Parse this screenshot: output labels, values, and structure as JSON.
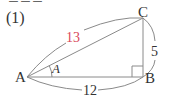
{
  "problem": {
    "number_label": "(1)",
    "top_cut_text": "ーーー"
  },
  "triangle": {
    "vertices": {
      "A": {
        "label": "A",
        "x": 27,
        "y": 77
      },
      "B": {
        "label": "B",
        "x": 143,
        "y": 77
      },
      "C": {
        "label": "C",
        "x": 143,
        "y": 18
      }
    },
    "sides": {
      "AC": {
        "label": "13",
        "color": "#d9465a"
      },
      "AB": {
        "label": "12",
        "color": "#333333"
      },
      "BC": {
        "label": "5",
        "color": "#333333"
      }
    },
    "angle_label": "A",
    "right_angle_at": "B"
  },
  "colors": {
    "line": "#8a8a8a",
    "text": "#333333",
    "accent": "#d9465a"
  }
}
